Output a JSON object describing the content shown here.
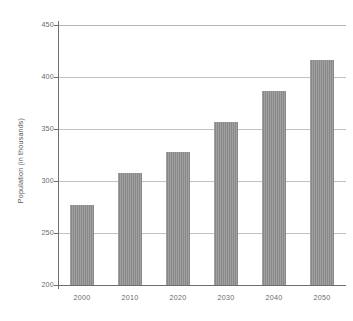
{
  "chart_data": {
    "type": "bar",
    "title": "",
    "subtitle": "",
    "xlabel": "",
    "ylabel": "Population (in thousands)",
    "categories": [
      "2000",
      "2010",
      "2020",
      "2030",
      "2040",
      "2050"
    ],
    "values": [
      277,
      308,
      328,
      357,
      387,
      416
    ],
    "series": [
      {
        "name": "Population",
        "values": [
          277,
          308,
          328,
          357,
          387,
          416
        ]
      }
    ],
    "ylim": [
      200,
      450
    ],
    "ytick_labels": [
      "200",
      "250",
      "300",
      "350",
      "400",
      "450"
    ],
    "ytick_values": [
      200,
      250,
      300,
      350,
      400,
      450
    ],
    "xtick_labels": [
      "2000",
      "2010",
      "2020",
      "2030",
      "2040",
      "2050"
    ],
    "grid": "horizontal",
    "gridlines_at": [
      250,
      300,
      350,
      400,
      450
    ],
    "legend": "none",
    "legend_position": "",
    "annotations": [],
    "bar_color": "#8d8d8d",
    "gridline_color": "#c2c2c2",
    "axis_color": "#6e6e6e",
    "tick_label_color": "#6b6b6b",
    "background_color": "#ffffff"
  }
}
